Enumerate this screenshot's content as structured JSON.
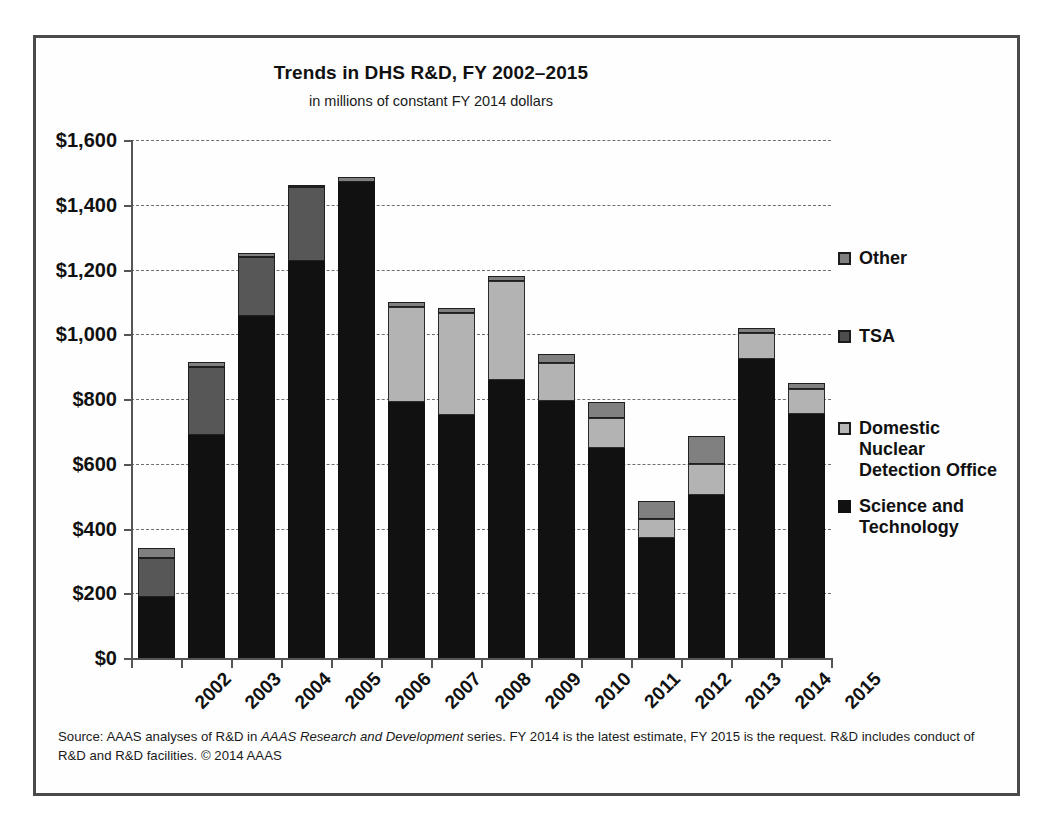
{
  "chart_data": {
    "type": "bar",
    "subtype": "stacked-bar",
    "title": "Trends in DHS R&D, FY 2002–2015",
    "subtitle": "in millions of constant FY 2014 dollars",
    "xlabel": "",
    "ylabel": "",
    "ylim": [
      0,
      1600
    ],
    "ytick_values": [
      0,
      200,
      400,
      600,
      800,
      1000,
      1200,
      1400,
      1600
    ],
    "ytick_labels": [
      "$0",
      "$200",
      "$400",
      "$600",
      "$800",
      "$1,000",
      "$1,200",
      "$1,400",
      "$1,600"
    ],
    "grid": "horizontal-dashed",
    "legend_position": "right",
    "categories": [
      "2002",
      "2003",
      "2004",
      "2005",
      "2006",
      "2007",
      "2008",
      "2009",
      "2010",
      "2011",
      "2012",
      "2013",
      "2014",
      "2015"
    ],
    "series": [
      {
        "name": "Science and Technology",
        "color": "#111111",
        "values": [
          190,
          690,
          1055,
          1225,
          1470,
          790,
          750,
          860,
          795,
          650,
          370,
          505,
          925,
          755
        ]
      },
      {
        "name": "Domestic Nuclear Detection Office",
        "color": "#b3b3b3",
        "values": [
          0,
          0,
          0,
          0,
          0,
          295,
          315,
          305,
          115,
          90,
          60,
          95,
          80,
          75
        ]
      },
      {
        "name": "TSA",
        "color": "#575757",
        "values": [
          120,
          210,
          185,
          230,
          0,
          0,
          0,
          0,
          0,
          0,
          0,
          0,
          0,
          0
        ]
      },
      {
        "name": "Other",
        "color": "#808080",
        "values": [
          30,
          15,
          10,
          7,
          15,
          15,
          15,
          15,
          30,
          50,
          55,
          85,
          15,
          20
        ]
      }
    ],
    "totals": [
      340,
      915,
      1250,
      1462,
      1485,
      1100,
      1080,
      1180,
      940,
      790,
      485,
      685,
      1020,
      850
    ]
  },
  "legend": {
    "items": [
      {
        "label": "Other",
        "swatch_class": "sw-other",
        "name": "legend-item-other",
        "top": 0
      },
      {
        "label": "TSA",
        "swatch_class": "sw-tsa",
        "name": "legend-item-tsa",
        "top": 78
      },
      {
        "label": "Domestic\nNuclear\nDetection Office",
        "swatch_class": "sw-dndo",
        "name": "legend-item-dndo",
        "top": 170
      },
      {
        "label": "Science and\nTechnology",
        "swatch_class": "sw-st",
        "name": "legend-item-science-technology",
        "top": 248
      }
    ]
  },
  "source": {
    "part1": "Source: AAAS analyses of R&D in ",
    "italic": "AAAS Research and Development",
    "part2": " series. FY 2014 is the latest estimate, FY 2015 is the request. R&D includes  conduct of R&D and R&D facilities. © 2014 AAAS"
  }
}
